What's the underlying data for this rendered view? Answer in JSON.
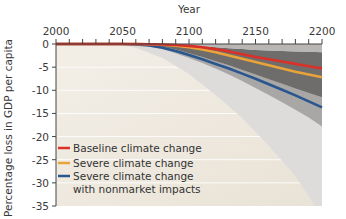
{
  "chart_data": {
    "type": "line",
    "title": "",
    "xlabel": "Year",
    "ylabel": "Percentage loss in GDP per capita",
    "xlim": [
      2000,
      2200
    ],
    "ylim": [
      -35,
      0
    ],
    "x_ticks": [
      2000,
      2050,
      2100,
      2150,
      2200
    ],
    "x_minor_step": 10,
    "y_ticks": [
      0,
      -5,
      -10,
      -15,
      -20,
      -25,
      -30,
      -35
    ],
    "x_axis_position": "top",
    "grid": "partial white horizontal lines",
    "legend_position": "lower left inside",
    "x": [
      2000,
      2050,
      2060,
      2070,
      2080,
      2090,
      2100,
      2110,
      2120,
      2130,
      2140,
      2150,
      2160,
      2170,
      2180,
      2190,
      2200
    ],
    "series": [
      {
        "name": "Baseline climate change",
        "color": "#d9312a",
        "values": [
          0,
          0,
          0,
          -0.05,
          -0.1,
          -0.2,
          -0.4,
          -0.7,
          -1.1,
          -1.6,
          -2.2,
          -2.8,
          -3.3,
          -3.8,
          -4.3,
          -4.8,
          -5.3
        ]
      },
      {
        "name": "Severe climate change",
        "color": "#e8a33a",
        "values": [
          0,
          0,
          0,
          -0.05,
          -0.15,
          -0.35,
          -0.7,
          -1.2,
          -1.8,
          -2.5,
          -3.2,
          -3.9,
          -4.6,
          -5.3,
          -6.0,
          -6.6,
          -7.2
        ]
      },
      {
        "name": "Severe climate change with nonmarket impacts",
        "color": "#2a5690",
        "values": [
          0,
          0,
          -0.1,
          -0.3,
          -0.8,
          -1.5,
          -2.4,
          -3.3,
          -4.3,
          -5.3,
          -6.4,
          -7.5,
          -8.7,
          -9.9,
          -11.1,
          -12.4,
          -13.7
        ]
      }
    ],
    "bands": [
      {
        "name": "light upper band",
        "color": "#b9b7b5",
        "upper": [
          0,
          0,
          0,
          0,
          0,
          0,
          0,
          0,
          0,
          0,
          0,
          0,
          0,
          0,
          0,
          0,
          0
        ],
        "lower": [
          0,
          0,
          0,
          0,
          -0.05,
          -0.15,
          -0.3,
          -0.5,
          -0.7,
          -0.9,
          -1.1,
          -1.3,
          -1.4,
          -1.5,
          -1.6,
          -1.7,
          -1.8
        ]
      },
      {
        "name": "dark central band",
        "color": "#6f6d6b",
        "upper": [
          0,
          0,
          0,
          0,
          -0.05,
          -0.15,
          -0.3,
          -0.5,
          -0.7,
          -0.9,
          -1.1,
          -1.3,
          -1.4,
          -1.5,
          -1.6,
          -1.7,
          -1.8
        ],
        "lower": [
          0,
          0,
          -0.05,
          -0.2,
          -0.6,
          -1.2,
          -2.0,
          -2.8,
          -3.7,
          -4.6,
          -5.6,
          -6.6,
          -7.6,
          -8.6,
          -9.6,
          -10.6,
          -11.5
        ]
      },
      {
        "name": "medium lower band",
        "color": "#a9a7a5",
        "upper": [
          0,
          0,
          -0.05,
          -0.2,
          -0.6,
          -1.2,
          -2.0,
          -2.8,
          -3.7,
          -4.6,
          -5.6,
          -6.6,
          -7.6,
          -8.6,
          -9.6,
          -10.6,
          -11.5
        ],
        "lower": [
          0,
          0,
          -0.15,
          -0.5,
          -1.1,
          -2.0,
          -3.0,
          -4.1,
          -5.3,
          -6.6,
          -8.0,
          -9.5,
          -11.0,
          -12.6,
          -14.2,
          -15.9,
          -17.8
        ]
      }
    ],
    "background_wedge": {
      "name": "very light outer region",
      "color": "#dddcda",
      "edge": [
        [
          2045,
          0
        ],
        [
          2060,
          -0.8
        ],
        [
          2080,
          -3
        ],
        [
          2100,
          -6.5
        ],
        [
          2120,
          -11
        ],
        [
          2140,
          -16
        ],
        [
          2160,
          -22
        ],
        [
          2180,
          -28.5
        ],
        [
          2195,
          -35
        ]
      ]
    },
    "plot_background": "#efe9df",
    "gridline_color": "#ffffff"
  },
  "legend": {
    "items": [
      {
        "label": "Baseline climate change",
        "color": "#d9312a"
      },
      {
        "label": "Severe climate change",
        "color": "#e8a33a"
      },
      {
        "label": "Severe climate change",
        "label2": "with nonmarket impacts",
        "color": "#2a5690"
      }
    ]
  }
}
